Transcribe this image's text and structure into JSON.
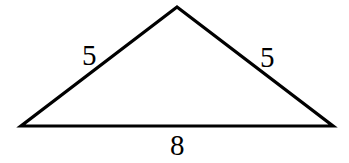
{
  "diagram": {
    "type": "isosceles-triangle",
    "stroke_color": "#000000",
    "background": "#ffffff",
    "vertices": {
      "apex": [
        177,
        7
      ],
      "left": [
        21,
        126
      ],
      "right": [
        333,
        126
      ]
    },
    "sides": [
      {
        "name": "left-side",
        "label": "5"
      },
      {
        "name": "right-side",
        "label": "5"
      },
      {
        "name": "base",
        "label": "8"
      }
    ]
  }
}
